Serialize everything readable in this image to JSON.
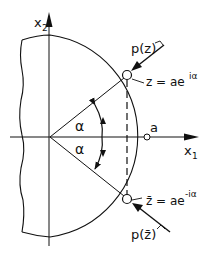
{
  "diagram": {
    "axes": {
      "x_axis_label": "x",
      "x_axis_sub": "1",
      "y_axis_label": "x",
      "y_axis_sub": "2"
    },
    "angle_labels": [
      "α",
      "α"
    ],
    "radius_label": "a",
    "points": {
      "z": {
        "label": "z = ae",
        "exponent": "iα"
      },
      "z_bar": {
        "label": "z̄ = ae",
        "exponent": "-iα"
      }
    },
    "loads": {
      "upper": "p(z)",
      "lower": "p(z̄)"
    },
    "colors": {
      "stroke": "#111111",
      "background": "#ffffff"
    }
  }
}
